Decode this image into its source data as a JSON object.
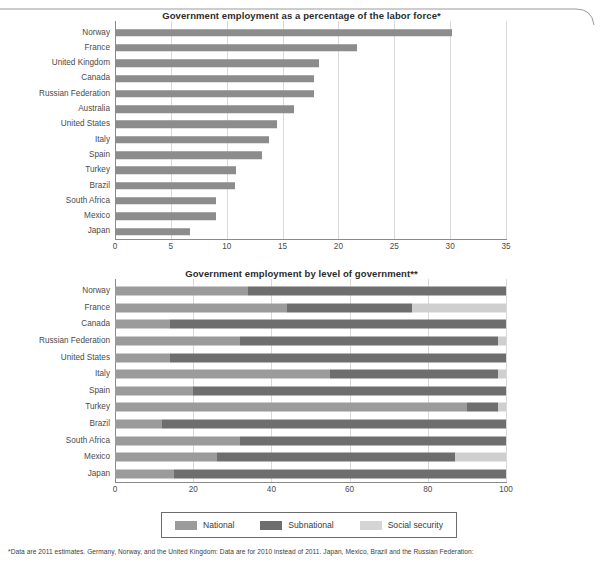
{
  "frame": {
    "has_top_rounded_border": true
  },
  "chart_data": [
    {
      "id": "chart1",
      "type": "bar",
      "orientation": "horizontal",
      "title": "Government employment as a percentage of the labor force*",
      "xlabel": "",
      "ylabel": "",
      "xlim": [
        0,
        35
      ],
      "xticks": [
        0,
        5,
        10,
        15,
        20,
        25,
        30,
        35
      ],
      "grid": true,
      "legend": null,
      "bar_color": "#8c8c8c",
      "categories": [
        "Norway",
        "France",
        "United Kingdom",
        "Canada",
        "Russian Federation",
        "Australia",
        "United States",
        "Italy",
        "Spain",
        "Turkey",
        "Brazil",
        "South Africa",
        "Mexico",
        "Japan"
      ],
      "values": [
        30.2,
        21.7,
        18.3,
        17.8,
        17.8,
        16.0,
        14.5,
        13.8,
        13.2,
        10.8,
        10.7,
        9.0,
        9.0,
        6.7
      ]
    },
    {
      "id": "chart2",
      "type": "bar",
      "subtype": "stacked-100",
      "orientation": "horizontal",
      "title": "Government employment by level of government**",
      "xlabel": "",
      "ylabel": "",
      "xlim": [
        0,
        100
      ],
      "xticks": [
        0,
        20,
        40,
        60,
        80,
        100
      ],
      "grid": true,
      "legend_position": "bottom",
      "series": [
        {
          "name": "National",
          "color": "#9b9b9b",
          "values": [
            34,
            44,
            14,
            32,
            14,
            55,
            20,
            90,
            12,
            32,
            26,
            15
          ]
        },
        {
          "name": "Subnational",
          "color": "#6e6e6e",
          "values": [
            66,
            32,
            86,
            66,
            86,
            43,
            80,
            8,
            88,
            68,
            61,
            85
          ]
        },
        {
          "name": "Social security",
          "color": "#cfcfcf",
          "values": [
            0,
            24,
            0,
            2,
            0,
            2,
            0,
            2,
            0,
            0,
            13,
            0
          ]
        }
      ],
      "categories": [
        "Norway",
        "France",
        "Canada",
        "Russian Federation",
        "United States",
        "Italy",
        "Spain",
        "Turkey",
        "Brazil",
        "South Africa",
        "Mexico",
        "Japan"
      ]
    }
  ],
  "legend": {
    "items": [
      {
        "label": "National",
        "color": "#9b9b9b"
      },
      {
        "label": "Subnational",
        "color": "#6e6e6e"
      },
      {
        "label": "Social security",
        "color": "#d5d5d5"
      }
    ]
  },
  "footnote": "*Data are 2011 estimates. Germany, Norway, and the United Kingdom: Data are for 2010 instead of 2011. Japan, Mexico, Brazil and the Russian Federation:"
}
